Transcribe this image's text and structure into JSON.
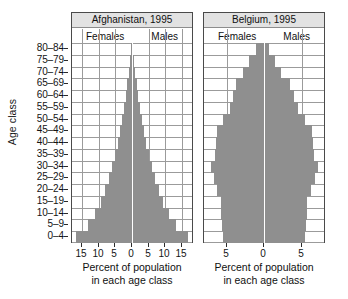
{
  "figure": {
    "y_axis_title": "Age class",
    "age_classes": [
      "0-4",
      "5-9",
      "10-14",
      "15-19",
      "20-24",
      "25-29",
      "30-34",
      "35-39",
      "40-44",
      "45-49",
      "50-54",
      "55-59",
      "60-64",
      "65-69",
      "70-74",
      "75-79",
      "80-84"
    ],
    "colors": {
      "bar": "#8f8f8f",
      "grid": "#9b9b9b",
      "panel_border": "#4a4a4a",
      "title_band": "#e2e2e2",
      "center_line": "#ffffff",
      "text": "#101010"
    }
  },
  "panels": [
    {
      "id": "afghanistan",
      "title": "Afghanistan, 1995",
      "female_label": "Females",
      "male_label": "Males",
      "xlabel_line1": "Percent of population",
      "xlabel_line2": "in each age class",
      "xticks": [
        15,
        10,
        5,
        0,
        5,
        10,
        15
      ],
      "xtick_values": [
        -15,
        -10,
        -5,
        0,
        5,
        10,
        15
      ]
    },
    {
      "id": "belgium",
      "title": "Belgium, 1995",
      "female_label": "Females",
      "male_label": "Males",
      "xlabel_line1": "Percent of population",
      "xlabel_line2": "in each age class",
      "xticks": [
        5,
        0,
        5
      ],
      "xtick_values": [
        -5,
        0,
        5
      ]
    }
  ],
  "chart_data": {
    "type": "bar",
    "subtype": "population-pyramid",
    "ylabel": "Age class",
    "xlabel": "Percent of population in each age class",
    "categories": [
      "0-4",
      "5-9",
      "10-14",
      "15-19",
      "20-24",
      "25-29",
      "30-34",
      "35-39",
      "40-44",
      "45-49",
      "50-54",
      "55-59",
      "60-64",
      "65-69",
      "70-74",
      "75-79",
      "80-84"
    ],
    "grid": true,
    "legend_position": "in-panel",
    "charts": [
      {
        "name": "Afghanistan, 1995",
        "xlim": [
          -18,
          18
        ],
        "xticks": [
          -15,
          -10,
          -5,
          0,
          5,
          10,
          15
        ],
        "xticklabels": [
          "15",
          "10",
          "5",
          "0",
          "5",
          "10",
          "15"
        ],
        "series": [
          {
            "name": "Females",
            "side": "left",
            "values": [
              16.8,
              13.2,
              11.0,
              9.2,
              8.0,
              7.0,
              6.0,
              5.1,
              4.3,
              3.6,
              3.0,
              2.4,
              1.9,
              1.4,
              1.0,
              0.6,
              0.3
            ]
          },
          {
            "name": "Males",
            "side": "right",
            "values": [
              16.8,
              13.2,
              11.0,
              9.2,
              8.0,
              7.0,
              6.0,
              5.1,
              4.3,
              3.6,
              3.0,
              2.4,
              1.9,
              1.4,
              1.0,
              0.6,
              0.3
            ]
          }
        ]
      },
      {
        "name": "Belgium, 1995",
        "xlim": [
          -8,
          8
        ],
        "xticks": [
          -5,
          0,
          5
        ],
        "xticklabels": [
          "5",
          "0",
          "5"
        ],
        "series": [
          {
            "name": "Females",
            "side": "left",
            "values": [
              5.5,
              5.6,
              5.7,
              5.7,
              6.2,
              6.7,
              7.1,
              6.6,
              6.4,
              6.3,
              5.4,
              4.6,
              4.2,
              3.8,
              2.8,
              2.0,
              1.1
            ]
          },
          {
            "name": "Males",
            "side": "right",
            "values": [
              5.5,
              5.6,
              5.7,
              5.7,
              6.2,
              6.8,
              7.2,
              6.7,
              6.5,
              6.4,
              5.5,
              4.5,
              4.0,
              3.4,
              2.3,
              1.4,
              0.6
            ]
          }
        ]
      }
    ]
  }
}
